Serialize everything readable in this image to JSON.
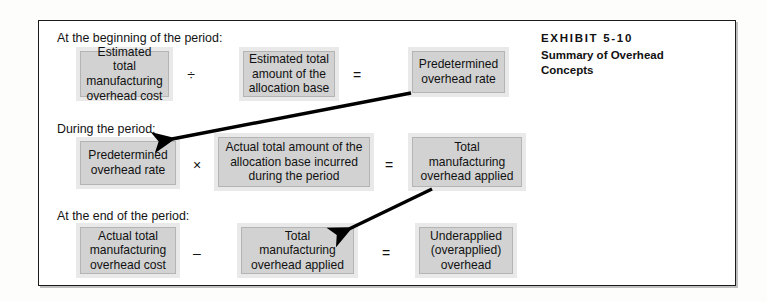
{
  "exhibit": {
    "number": "EXHIBIT 5-10",
    "title": "Summary of Overhead Concepts"
  },
  "sections": [
    {
      "caption": "At the beginning of the period:",
      "boxes": [
        "Estimated total manufacturing overhead cost",
        "Estimated total amount of the allocation base",
        "Predetermined overhead rate"
      ],
      "operators": [
        "÷",
        "="
      ]
    },
    {
      "caption": "During the period:",
      "boxes": [
        "Predetermined overhead rate",
        "Actual total amount of the allocation base incurred during the period",
        "Total manufacturing overhead applied"
      ],
      "operators": [
        "×",
        "="
      ]
    },
    {
      "caption": "At the end of the period:",
      "boxes": [
        "Actual total manufacturing overhead cost",
        "Total manufacturing overhead applied",
        "Underapplied (overapplied) overhead"
      ],
      "operators": [
        "–",
        "="
      ]
    }
  ],
  "arrows": [
    {
      "name": "predetermined-rate-carryforward-arrow",
      "from": "Predetermined overhead rate (beginning of period result)",
      "to": "Predetermined overhead rate (during the period input)"
    },
    {
      "name": "overhead-applied-carryforward-arrow",
      "from": "Total manufacturing overhead applied (during the period result)",
      "to": "Total manufacturing overhead applied (end of period input)"
    }
  ],
  "colors": {
    "box_fill": "#d2d2d2",
    "box_halo": "#e9e9e9",
    "box_border": "#b4b4b4",
    "frame_border": "#1b1b1b",
    "text": "#111111",
    "arrow": "#000000"
  }
}
